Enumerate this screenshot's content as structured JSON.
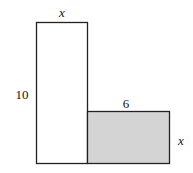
{
  "diagram": {
    "type": "geometry-rectangles",
    "shapes": [
      {
        "name": "tall-rectangle",
        "fill": "#ffffff",
        "stroke": "#222222",
        "width_label": "x",
        "height_label": "10"
      },
      {
        "name": "shaded-rectangle",
        "fill": "#d4d4d4",
        "stroke": "#222222",
        "width_label": "6",
        "height_label": "x"
      }
    ],
    "labels": {
      "tall_top": "x",
      "tall_left": "10",
      "shaded_top": "6",
      "shaded_right": "x"
    }
  }
}
